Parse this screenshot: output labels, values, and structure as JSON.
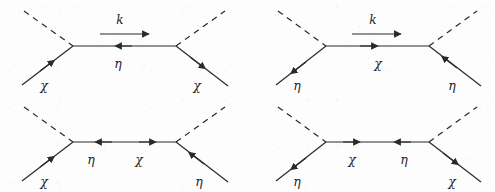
{
  "figure": {
    "type": "feynman-diagram-grid",
    "rows": 2,
    "columns": 2,
    "background_color": "#fdfdfd",
    "line_color": "#2a2a2a",
    "label_color": "#232323",
    "symbols": {
      "chi": "χ",
      "eta": "η",
      "momentum": "k"
    }
  },
  "diagrams": [
    {
      "id": "diagram-top-left",
      "position": "top-left",
      "momentum_label": "k",
      "momentum_arrow_direction": "right",
      "has_momentum_arrow": true,
      "propagator_segments": [
        {
          "label": "η",
          "arrow_direction": "left",
          "label_position": "below"
        }
      ],
      "external_legs": [
        {
          "name": "upper-left",
          "style": "dashed",
          "label": "",
          "arrow": "none"
        },
        {
          "name": "upper-right",
          "style": "dashed",
          "label": "",
          "arrow": "none"
        },
        {
          "name": "lower-left",
          "style": "solid",
          "label": "χ",
          "arrow": "incoming"
        },
        {
          "name": "lower-right",
          "style": "solid",
          "label": "χ",
          "arrow": "outgoing"
        }
      ]
    },
    {
      "id": "diagram-top-right",
      "position": "top-right",
      "momentum_label": "k",
      "momentum_arrow_direction": "right",
      "has_momentum_arrow": true,
      "propagator_segments": [
        {
          "label": "χ",
          "arrow_direction": "right",
          "label_position": "below"
        }
      ],
      "external_legs": [
        {
          "name": "upper-left",
          "style": "dashed",
          "label": "",
          "arrow": "none"
        },
        {
          "name": "upper-right",
          "style": "dashed",
          "label": "",
          "arrow": "none"
        },
        {
          "name": "lower-left",
          "style": "solid",
          "label": "η",
          "arrow": "outgoing"
        },
        {
          "name": "lower-right",
          "style": "solid",
          "label": "η",
          "arrow": "incoming"
        }
      ]
    },
    {
      "id": "diagram-bottom-left",
      "position": "bottom-left",
      "momentum_label": "",
      "momentum_arrow_direction": "",
      "has_momentum_arrow": false,
      "propagator_segments": [
        {
          "label": "η",
          "arrow_direction": "left",
          "label_position": "below"
        },
        {
          "label": "χ",
          "arrow_direction": "right",
          "label_position": "below"
        }
      ],
      "external_legs": [
        {
          "name": "upper-left",
          "style": "dashed",
          "label": "",
          "arrow": "none"
        },
        {
          "name": "upper-right",
          "style": "dashed",
          "label": "",
          "arrow": "none"
        },
        {
          "name": "lower-left",
          "style": "solid",
          "label": "χ",
          "arrow": "incoming"
        },
        {
          "name": "lower-right",
          "style": "solid",
          "label": "η",
          "arrow": "incoming"
        }
      ]
    },
    {
      "id": "diagram-bottom-right",
      "position": "bottom-right",
      "momentum_label": "",
      "momentum_arrow_direction": "",
      "has_momentum_arrow": false,
      "propagator_segments": [
        {
          "label": "χ",
          "arrow_direction": "right",
          "label_position": "below"
        },
        {
          "label": "η",
          "arrow_direction": "left",
          "label_position": "below"
        }
      ],
      "external_legs": [
        {
          "name": "upper-left",
          "style": "dashed",
          "label": "",
          "arrow": "none"
        },
        {
          "name": "upper-right",
          "style": "dashed",
          "label": "",
          "arrow": "none"
        },
        {
          "name": "lower-left",
          "style": "solid",
          "label": "η",
          "arrow": "outgoing"
        },
        {
          "name": "lower-right",
          "style": "solid",
          "label": "χ",
          "arrow": "outgoing"
        }
      ]
    }
  ],
  "labels": {
    "d1_momentum": "k",
    "d1_propagator": "η",
    "d1_leg_lower_left": "χ",
    "d1_leg_lower_right": "χ",
    "d2_momentum": "k",
    "d2_propagator": "χ",
    "d2_leg_lower_left": "η",
    "d2_leg_lower_right": "η",
    "d3_propagator_left": "η",
    "d3_propagator_right": "χ",
    "d3_leg_lower_left": "χ",
    "d3_leg_lower_right": "η",
    "d4_propagator_left": "χ",
    "d4_propagator_right": "η",
    "d4_leg_lower_left": "η",
    "d4_leg_lower_right": "χ"
  }
}
